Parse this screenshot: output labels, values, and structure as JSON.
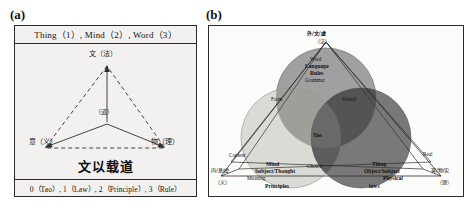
{
  "figure": {
    "panel_a_letter": "(a)",
    "panel_b_letter": "(b)"
  },
  "panel_a": {
    "header": "Thing（1）, Mind（2）, Word（3）",
    "footer": "0（Tao）, 1（Law）, 2（Principle）, 3（Rule）",
    "motto": "文以载道",
    "nodes": {
      "top": "文（法）",
      "left": "意（义）",
      "right": "物（理）",
      "center": "（道）"
    }
  },
  "panel_b": {
    "apex": {
      "line1": "外/文/虚",
      "line2": "（法）"
    },
    "top_circle": {
      "l1": "Word",
      "l2": "Language",
      "l3": "Rules",
      "l4": "Grammar",
      "left_edge": "Form",
      "right_edge": "Virtual"
    },
    "center": {
      "tao": "Tao",
      "choice": "Choice"
    },
    "left_circle": {
      "corner_cn1": "内/意/虚",
      "corner_cn2": "（义）",
      "content": "Content",
      "mind": "Mind",
      "subject": "Subject/Thought",
      "meaning": "Meaning",
      "principles": "Principles"
    },
    "right_circle": {
      "corner_cn1": "客/物/实",
      "corner_cn2": "（理）",
      "real": "Real",
      "thing": "Thing",
      "object": "Object/Subject",
      "physical": "Physical",
      "laws": "laws"
    }
  },
  "colors": {
    "ink": "#2b2b2b",
    "panel_a_bg": "#f2f1ef",
    "panel_b_bg": "#fbfbfa",
    "circle_top": "#9a9a9a",
    "circle_left": "#d4d4cf",
    "circle_right": "#6f6f6f",
    "overlap_dark": "#5a5a5a"
  }
}
